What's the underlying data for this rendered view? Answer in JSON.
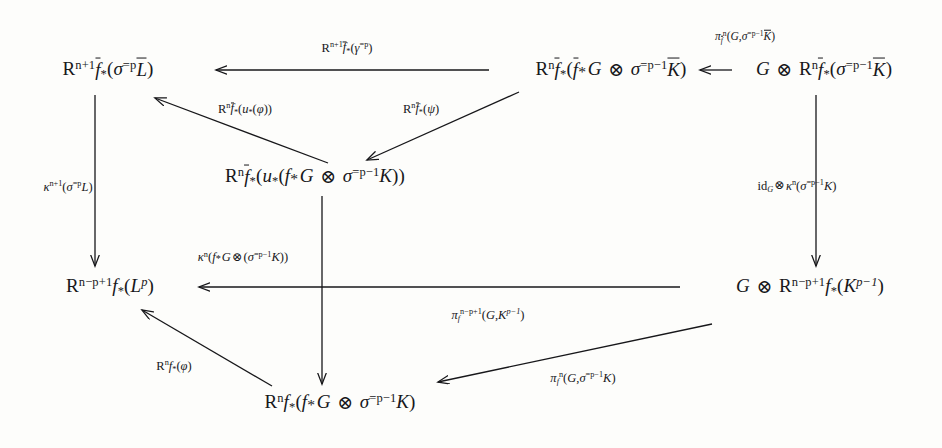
{
  "diagram": {
    "type": "commutative-diagram",
    "ink_color": "#17171a",
    "background_color": "#fdfdfb",
    "nodes": [
      {
        "id": "n-top-left",
        "name": "node-top-left",
        "plain": "R^{n+1} f̄_*(σ^{=p} L̄)",
        "x": 108,
        "y": 70
      },
      {
        "id": "n-top-mid",
        "name": "node-top-middle",
        "plain": "R^n f̄_*(f̄^* G ⊗ σ^{=p-1} K̄)",
        "x": 611,
        "y": 70
      },
      {
        "id": "n-top-right",
        "name": "node-top-right",
        "plain": "G ⊗ R^n f̄_*(σ^{=p-1} K̄)",
        "x": 824,
        "y": 70
      },
      {
        "id": "n-center",
        "name": "node-center",
        "plain": "R^n f̄_*(u_*(f^* G ⊗ σ^{=p-1} K))",
        "x": 315,
        "y": 177
      },
      {
        "id": "n-bottom-left",
        "name": "node-bottom-left",
        "plain": "R^{n-p+1} f_*(L^p)",
        "x": 110,
        "y": 287
      },
      {
        "id": "n-bottom-right",
        "name": "node-bottom-right",
        "plain": "G ⊗ R^{n-p+1} f_*(K^{p-1})",
        "x": 810,
        "y": 287
      },
      {
        "id": "n-bottom",
        "name": "node-bottom-center",
        "plain": "R^n f_*(f^* G ⊗ σ^{=p-1} K)",
        "x": 340,
        "y": 403
      }
    ],
    "arrows": [
      {
        "id": "a-top",
        "name": "arrow-top-horizontal",
        "from": "n-top-mid",
        "to": "n-top-left",
        "direction": "left",
        "label_plain": "R^{n+1} f̄_*(γ^{=p})",
        "label_x": 347,
        "label_y": 49,
        "x1": 489,
        "y1": 70,
        "x2": 216,
        "y2": 70
      },
      {
        "id": "a-top-right",
        "name": "arrow-top-right-horizontal",
        "from": "n-top-right",
        "to": "n-top-mid",
        "direction": "left",
        "label_plain": "π_f̄^n(G,σ^{=p-1} K̄)",
        "label_x": 745,
        "label_y": 37,
        "x1": 732,
        "y1": 70,
        "x2": 700,
        "y2": 70
      },
      {
        "id": "a-diag-ul",
        "name": "arrow-center-to-top-left",
        "from": "n-center",
        "to": "n-top-left",
        "direction": "up-left",
        "label_plain": "R^n f̄_*(u_*(φ))",
        "label_x": 245,
        "label_y": 110,
        "x1": 328,
        "y1": 163,
        "x2": 155,
        "y2": 98
      },
      {
        "id": "a-diag-dl",
        "name": "arrow-top-middle-to-center",
        "from": "n-top-mid",
        "to": "n-center",
        "direction": "down-left",
        "label_plain": "R^n f̄_*(ψ)",
        "label_x": 421,
        "label_y": 110,
        "x1": 519,
        "y1": 92,
        "x2": 367,
        "y2": 160
      },
      {
        "id": "a-left-vert",
        "name": "arrow-left-vertical",
        "from": "n-top-left",
        "to": "n-bottom-left",
        "direction": "down",
        "label_plain": "κ^{n+1}(σ^{=p} L)",
        "label_x": 68,
        "label_y": 187,
        "x1": 95,
        "y1": 95,
        "x2": 95,
        "y2": 266
      },
      {
        "id": "a-mid-vert",
        "name": "arrow-middle-vertical",
        "from": "n-center",
        "to": "n-bottom",
        "direction": "down",
        "label_plain": "κ^n(f^* G⊗(σ^{=p-1} K))",
        "label_x": 243,
        "label_y": 258,
        "x1": 322,
        "y1": 196,
        "x2": 322,
        "y2": 384
      },
      {
        "id": "a-right-vert",
        "name": "arrow-right-vertical",
        "from": "n-top-right",
        "to": "n-bottom-right",
        "direction": "down",
        "label_plain": "id_G⊗κ^n(σ^{=p-1} K)",
        "label_x": 797,
        "label_y": 187,
        "x1": 816,
        "y1": 95,
        "x2": 816,
        "y2": 266
      },
      {
        "id": "a-bottom-horiz",
        "name": "arrow-bottom-horizontal",
        "from": "n-bottom-right",
        "to": "n-bottom-left",
        "direction": "left",
        "label_plain": "π_f^{n-p+1}(G,K^{p-1})",
        "label_x": 488,
        "label_y": 316,
        "x1": 680,
        "y1": 287,
        "x2": 199,
        "y2": 287
      },
      {
        "id": "a-diag-bl",
        "name": "arrow-bottom-center-to-bottom-left",
        "from": "n-bottom",
        "to": "n-bottom-left",
        "direction": "up-left",
        "label_plain": "R^n f_*(φ)",
        "label_x": 174,
        "label_y": 367,
        "x1": 272,
        "y1": 386,
        "x2": 142,
        "y2": 310
      },
      {
        "id": "a-diag-br",
        "name": "arrow-bottom-right-to-bottom-center",
        "from": "n-bottom-right",
        "to": "n-bottom",
        "direction": "down-left",
        "label_plain": "π_f^n(G,σ^{=p-1} K)",
        "label_x": 583,
        "label_y": 379,
        "x1": 712,
        "y1": 324,
        "x2": 438,
        "y2": 382
      }
    ]
  }
}
